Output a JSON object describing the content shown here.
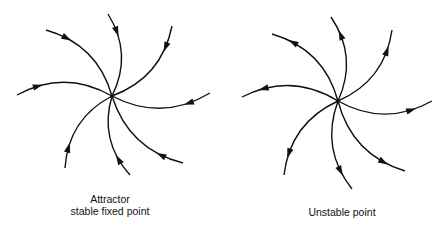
{
  "diagrams": [
    {
      "name": "attractor",
      "caption_line1": "Attractor",
      "caption_line2": "stable fixed point",
      "flow_direction": "inward",
      "center": [
        112,
        96
      ],
      "endpoints": [
        [
          108,
          14
        ],
        [
          172,
          26
        ],
        [
          210,
          93
        ],
        [
          183,
          163
        ],
        [
          130,
          175
        ],
        [
          65,
          168
        ],
        [
          17,
          95
        ],
        [
          46,
          30
        ]
      ]
    },
    {
      "name": "unstable-point",
      "caption_line1": "Unstable point",
      "flow_direction": "outward",
      "center": [
        338,
        101
      ],
      "endpoints": [
        [
          331,
          17
        ],
        [
          392,
          30
        ],
        [
          432,
          101
        ],
        [
          405,
          171
        ],
        [
          352,
          189
        ],
        [
          284,
          175
        ],
        [
          242,
          97
        ],
        [
          272,
          34
        ]
      ]
    }
  ],
  "colors": {
    "stroke": "#111111",
    "background": "#ffffff"
  }
}
